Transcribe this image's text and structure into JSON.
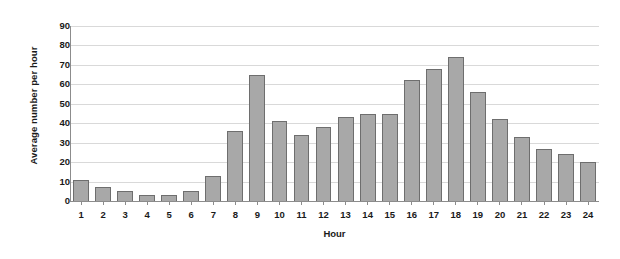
{
  "chart_data": {
    "type": "bar",
    "title": "",
    "xlabel": "Hour",
    "ylabel": "Average number per hour",
    "categories": [
      "1",
      "2",
      "3",
      "4",
      "5",
      "6",
      "7",
      "8",
      "9",
      "10",
      "11",
      "12",
      "13",
      "14",
      "15",
      "16",
      "17",
      "18",
      "19",
      "20",
      "21",
      "22",
      "23",
      "24"
    ],
    "values": [
      11,
      7,
      5,
      3,
      3,
      5,
      13,
      36,
      65,
      41,
      34,
      38,
      43,
      45,
      45,
      62,
      68,
      74,
      56,
      42,
      33,
      27,
      24,
      20
    ],
    "ylim": [
      0,
      90
    ],
    "ytick_values": [
      "0",
      "10",
      "20",
      "30",
      "40",
      "50",
      "60",
      "70",
      "80",
      "90"
    ],
    "ytick_step": 10,
    "grid": true,
    "legend": false,
    "bar_color": "#a8a8a8",
    "bar_border_color": "#6e6e6e",
    "gridline_color": "#d9d9d9",
    "axis_color": "#8c8c8c",
    "text_color": "#1a1a1a",
    "background": "#ffffff"
  }
}
